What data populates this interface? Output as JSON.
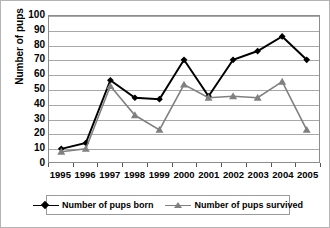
{
  "chart_data": {
    "type": "line",
    "title": "",
    "xlabel": "",
    "ylabel": "Number of pups",
    "categories": [
      "1995",
      "1996",
      "1997",
      "1998",
      "1999",
      "2000",
      "2001",
      "2002",
      "2003",
      "2004",
      "2005"
    ],
    "ylim": [
      0,
      100
    ],
    "yticks": [
      0,
      10,
      20,
      30,
      40,
      50,
      60,
      70,
      80,
      90,
      100
    ],
    "ytick_labels": [
      "0",
      "10",
      "20",
      "30",
      "40",
      "50",
      "60",
      "70",
      "80",
      "90",
      "100"
    ],
    "grid": true,
    "legend_position": "bottom",
    "series": [
      {
        "name": "Number of pups born",
        "color": "#000000",
        "marker": "diamond",
        "values": [
          9,
          13,
          56,
          44,
          43,
          70,
          45,
          70,
          76,
          86,
          70
        ]
      },
      {
        "name": "Number of pups survived",
        "color": "#808080",
        "marker": "triangle",
        "values": [
          7,
          9,
          52,
          32,
          22,
          53,
          44,
          45,
          44,
          55,
          22
        ]
      }
    ]
  },
  "legend": {
    "items": [
      {
        "label": "Number of pups born"
      },
      {
        "label": "Number of pups survived"
      }
    ]
  }
}
